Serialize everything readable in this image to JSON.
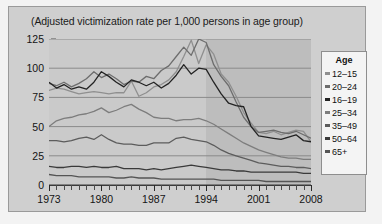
{
  "chart_data": {
    "type": "line",
    "title": "(Adjusted victimization rate per 1,000 persons in age group)",
    "xlabel": "",
    "ylabel": "",
    "xlim": [
      1973,
      2008
    ],
    "ylim": [
      0,
      125
    ],
    "ytick_labels": [
      "0",
      "25",
      "50",
      "75",
      "100",
      "125"
    ],
    "ytick_values": [
      0,
      25,
      50,
      75,
      100,
      125
    ],
    "xtick_labels": [
      "1973",
      "1980",
      "1987",
      "1994",
      "2001",
      "2008"
    ],
    "xtick_values": [
      1973,
      1980,
      1987,
      1994,
      2001,
      2008
    ],
    "grid": true,
    "legend_position": "right",
    "legend_title": "Age",
    "shaded_region": [
      1994,
      2008
    ],
    "x": [
      1973,
      1974,
      1975,
      1976,
      1977,
      1978,
      1979,
      1980,
      1981,
      1982,
      1983,
      1984,
      1985,
      1986,
      1987,
      1988,
      1989,
      1990,
      1991,
      1992,
      1993,
      1994,
      1995,
      1996,
      1997,
      1998,
      1999,
      2000,
      2001,
      2002,
      2003,
      2004,
      2005,
      2006,
      2007,
      2008
    ],
    "series": [
      {
        "name": "12-15",
        "color": "#8f8f8f",
        "values": [
          81,
          83,
          82,
          80,
          78,
          79,
          80,
          79,
          78,
          79,
          79,
          89,
          76,
          79,
          84,
          86,
          90,
          97,
          110,
          124,
          104,
          120,
          112,
          95,
          88,
          76,
          62,
          53,
          45,
          44,
          46,
          43,
          45,
          47,
          46,
          37
        ]
      },
      {
        "name": "20-24",
        "color": "#6d6d6d",
        "values": [
          87,
          85,
          88,
          84,
          87,
          91,
          97,
          92,
          95,
          91,
          86,
          89,
          88,
          93,
          91,
          98,
          102,
          110,
          118,
          111,
          125,
          122,
          103,
          93,
          85,
          71,
          58,
          50,
          45,
          46,
          47,
          45,
          44,
          46,
          43,
          40
        ]
      },
      {
        "name": "16-19",
        "color": "#232323",
        "values": [
          88,
          83,
          86,
          82,
          84,
          82,
          88,
          97,
          93,
          88,
          84,
          90,
          88,
          85,
          88,
          83,
          87,
          94,
          103,
          95,
          100,
          99,
          88,
          78,
          70,
          68,
          67,
          50,
          42,
          41,
          40,
          39,
          41,
          43,
          38,
          37
        ]
      },
      {
        "name": "25-34",
        "color": "#7d7d7d",
        "values": [
          50,
          55,
          57,
          58,
          60,
          61,
          63,
          66,
          62,
          64,
          67,
          69,
          65,
          62,
          58,
          57,
          57,
          55,
          56,
          56,
          57,
          55,
          52,
          48,
          44,
          40,
          36,
          33,
          30,
          28,
          26,
          24,
          23,
          23,
          22,
          22
        ]
      },
      {
        "name": "35-49",
        "color": "#5c5c5c",
        "values": [
          38,
          38,
          37,
          38,
          40,
          41,
          39,
          43,
          39,
          36,
          35,
          35,
          34,
          34,
          36,
          36,
          36,
          40,
          41,
          39,
          38,
          37,
          34,
          30,
          27,
          25,
          23,
          21,
          19,
          18,
          17,
          16,
          16,
          15,
          15,
          14
        ]
      },
      {
        "name": "50-64",
        "color": "#3a3a3a",
        "values": [
          16,
          15,
          15,
          16,
          16,
          15,
          16,
          15,
          15,
          16,
          14,
          14,
          14,
          13,
          14,
          13,
          14,
          15,
          16,
          17,
          16,
          15,
          14,
          13,
          13,
          12,
          12,
          11,
          11,
          11,
          11,
          11,
          11,
          11,
          10,
          10
        ]
      },
      {
        "name": "65+",
        "color": "#555555",
        "values": [
          9,
          8,
          8,
          8,
          7,
          7,
          7,
          7,
          7,
          6,
          6,
          7,
          6,
          6,
          6,
          5,
          5,
          5,
          5,
          5,
          5,
          5,
          5,
          4,
          4,
          4,
          4,
          4,
          4,
          3,
          3,
          3,
          3,
          3,
          3,
          3
        ]
      }
    ]
  }
}
